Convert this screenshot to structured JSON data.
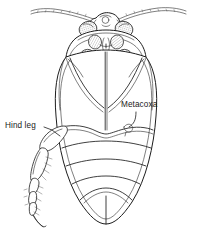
{
  "figure": {
    "type": "scientific-line-drawing",
    "background_color": "#ffffff",
    "line_color": "#1d1d1d",
    "text_color": "#1a1a1a",
    "width": 206,
    "height": 232
  },
  "labels": {
    "hind_leg": "Hind leg",
    "metacoxa": "Metacoxa"
  },
  "parts": {
    "antenna_left": "left-antenna",
    "antenna_right": "right-antenna",
    "eye_left": "left-compound-eye",
    "eye_right": "right-compound-eye",
    "head": "head",
    "prothorax": "prothorax",
    "mesothorax": "mesothorax",
    "metathorax": "metathorax",
    "metacoxa_left": "left-metacoxa",
    "metacoxa_right": "right-metacoxa",
    "abdomen": "abdomen",
    "femur": "hind-femur",
    "tibia": "hind-tibia",
    "tarsus": "hind-tarsus",
    "claw": "tarsal-claw"
  }
}
